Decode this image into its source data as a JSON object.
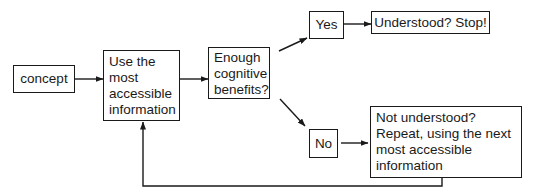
{
  "diagram": {
    "nodes": {
      "concept": {
        "label": "concept"
      },
      "use_info": {
        "lines": [
          "Use the",
          "most",
          "accessible",
          "information"
        ]
      },
      "enough": {
        "lines": [
          "Enough",
          "cognitive",
          "benefits?"
        ]
      },
      "yes": {
        "label": "Yes"
      },
      "stop": {
        "label": "Understood? Stop!"
      },
      "no": {
        "label": "No"
      },
      "repeat": {
        "lines": [
          "Not understood?",
          "Repeat, using the next",
          "most accessible",
          "information"
        ]
      }
    },
    "edges": [
      {
        "from": "concept",
        "to": "use_info"
      },
      {
        "from": "use_info",
        "to": "enough"
      },
      {
        "from": "enough",
        "to": "yes"
      },
      {
        "from": "yes",
        "to": "stop"
      },
      {
        "from": "enough",
        "to": "no"
      },
      {
        "from": "no",
        "to": "repeat"
      },
      {
        "from": "repeat",
        "to": "use_info"
      }
    ],
    "colors": {
      "stroke": "#1a1a1a",
      "background": "#ffffff"
    }
  }
}
